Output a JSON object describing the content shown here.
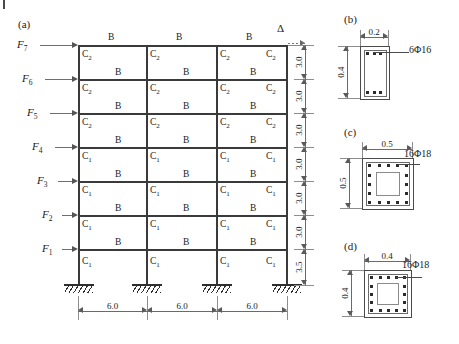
{
  "figure": {
    "panels": [
      {
        "id": "a",
        "tag": "(a)"
      },
      {
        "id": "b",
        "tag": "(b)"
      },
      {
        "id": "c",
        "tag": "(c)"
      },
      {
        "id": "d",
        "tag": "(d)"
      }
    ]
  },
  "frame": {
    "stories": 7,
    "bays": 3,
    "forces": [
      {
        "label": "F",
        "sub": "7"
      },
      {
        "label": "F",
        "sub": "6"
      },
      {
        "label": "F",
        "sub": "5"
      },
      {
        "label": "F",
        "sub": "4"
      },
      {
        "label": "F",
        "sub": "3"
      },
      {
        "label": "F",
        "sub": "2"
      },
      {
        "label": "F",
        "sub": "1"
      }
    ],
    "displacement_symbol": "Δ",
    "beam_label": "B",
    "column_labels": {
      "upper": "C",
      "upper_sub": "2",
      "lower": "C",
      "lower_sub": "1"
    },
    "story_heights": [
      "3.0",
      "3.0",
      "3.0",
      "3.0",
      "3.0",
      "3.0",
      "3.5"
    ],
    "bay_widths": [
      "6.0",
      "6.0",
      "6.0"
    ],
    "column_label_by_story": [
      "C2",
      "C2",
      "C2",
      "C1",
      "C1",
      "C1",
      "C1"
    ]
  },
  "sections": {
    "b": {
      "tag": "(b)",
      "width": "0.2",
      "height": "0.4",
      "rebar": "6Φ16",
      "bars_top": 3,
      "bars_bottom": 3
    },
    "c": {
      "tag": "(c)",
      "width": "0.5",
      "height": "0.5",
      "rebar": "16Φ18",
      "bars_per_side": 5
    },
    "d": {
      "tag": "(d)",
      "width": "0.4",
      "height": "0.4",
      "rebar": "16Φ18",
      "bars_per_side": 5
    }
  },
  "colors": {
    "line": "#3a3a3a",
    "dimension": "#6a6a6a",
    "arrow": "#555555",
    "rebar": "#2b2b2b"
  }
}
